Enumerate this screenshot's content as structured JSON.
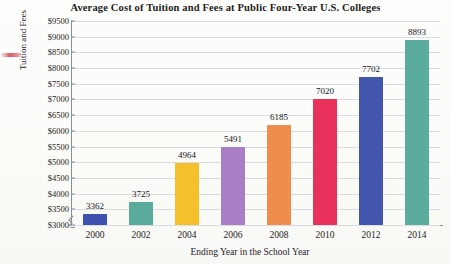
{
  "chart_data": {
    "type": "bar",
    "title": "Average Cost of Tuition and Fees at Public Four-Year U.S. Colleges",
    "xlabel": "Ending Year in the School Year",
    "ylabel": "Tuition and Fees",
    "categories": [
      "2000",
      "2002",
      "2004",
      "2006",
      "2008",
      "2010",
      "2012",
      "2014"
    ],
    "values": [
      3362,
      3725,
      4964,
      5491,
      6185,
      7020,
      7702,
      8893
    ],
    "bar_colors": [
      "#4050ad",
      "#5bab9c",
      "#f5c02c",
      "#a87ec6",
      "#f08c4c",
      "#e8325c",
      "#4356ad",
      "#5cac9e"
    ],
    "ylim": [
      3000,
      9500
    ],
    "ytick_step": 500,
    "ytick_labels": [
      "$9500",
      "$9000",
      "$8500",
      "$8000",
      "$7500",
      "$7000",
      "$6500",
      "$6000",
      "$5500",
      "$5000",
      "$4500",
      "$4000",
      "$3500",
      "$3000"
    ],
    "ytick_values": [
      9500,
      9000,
      8500,
      8000,
      7500,
      7000,
      6500,
      6000,
      5500,
      5000,
      4500,
      4000,
      3500,
      3000
    ],
    "grid": "horizontal",
    "legend": "none",
    "axis_break": true,
    "axis_break_note": "y-axis broken below $3000"
  },
  "annotation": {
    "red_mark_name": "red-pen-mark"
  }
}
